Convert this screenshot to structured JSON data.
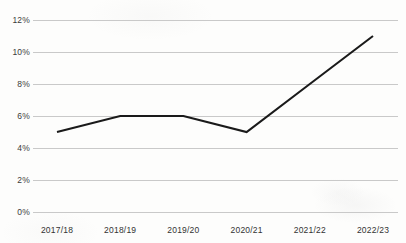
{
  "chart_data": {
    "type": "line",
    "title": "",
    "subtitle": "",
    "xlabel": "",
    "ylabel": "",
    "categories": [
      "2017/18",
      "2018/19",
      "2019/20",
      "2020/21",
      "2021/22",
      "2022/23"
    ],
    "values": [
      5,
      6,
      6,
      5,
      8,
      11
    ],
    "value_labels": [
      "5%",
      "6%",
      "6%",
      "5%",
      "8%",
      "11%"
    ],
    "series": [
      {
        "name": "",
        "values": [
          5,
          6,
          6,
          5,
          8,
          11
        ]
      }
    ],
    "ylim": [
      0,
      12
    ],
    "ytick_values": [
      0,
      2,
      4,
      6,
      8,
      10,
      12
    ],
    "ytick_labels": [
      "0%",
      "2%",
      "4%",
      "6%",
      "8%",
      "10%",
      "12%"
    ],
    "xtick_labels": [
      "2017/18",
      "2018/19",
      "2019/20",
      "2020/21",
      "2021/22",
      "2022/23"
    ],
    "grid": {
      "horizontal": true,
      "vertical": false,
      "color": "#c9c9c9"
    },
    "legend": {
      "visible": false,
      "position": "none",
      "entries": []
    },
    "markers": false,
    "line_color": "#1a1a1a",
    "line_width": 2.1,
    "background_color": "#fdfdfc",
    "axis_line_visible": false
  }
}
